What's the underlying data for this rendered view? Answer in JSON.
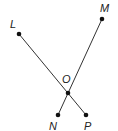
{
  "diagram": {
    "type": "geometry",
    "points": [
      {
        "name": "L",
        "label": "L",
        "x": 19,
        "y": 34,
        "lx": 10,
        "ly": 28
      },
      {
        "name": "M",
        "label": "M",
        "x": 102,
        "y": 19,
        "lx": 100,
        "ly": 12
      },
      {
        "name": "O",
        "label": "O",
        "x": 68,
        "y": 93,
        "lx": 62,
        "ly": 83
      },
      {
        "name": "N",
        "label": "N",
        "x": 58,
        "y": 115,
        "lx": 49,
        "ly": 130
      },
      {
        "name": "P",
        "label": "P",
        "x": 86,
        "y": 115,
        "lx": 84,
        "ly": 130
      }
    ],
    "segments": [
      {
        "from": "L",
        "to": "P"
      },
      {
        "from": "M",
        "to": "N"
      }
    ],
    "colors": {
      "line": "#333333",
      "point": "#111111",
      "label": "#222222"
    }
  }
}
